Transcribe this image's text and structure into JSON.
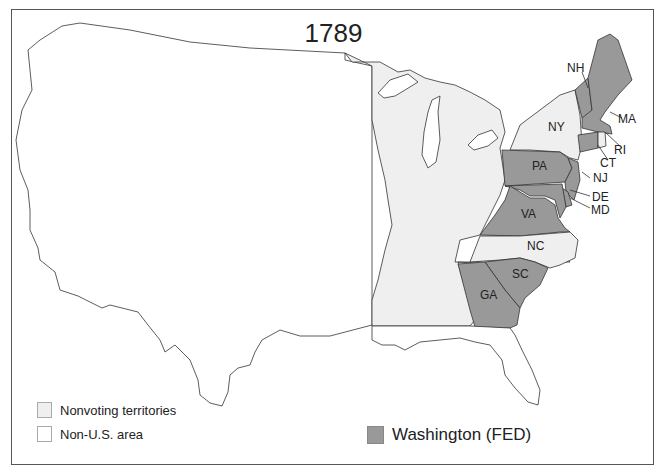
{
  "map": {
    "title": "1789",
    "colors": {
      "fed": "#999999",
      "nonvoting": "#efefef",
      "non_us": "#ffffff",
      "border": "#333333"
    },
    "states": [
      {
        "abbr": "NH",
        "party": "FED"
      },
      {
        "abbr": "MA",
        "party": "FED"
      },
      {
        "abbr": "RI",
        "party": "nonvoting"
      },
      {
        "abbr": "CT",
        "party": "FED"
      },
      {
        "abbr": "NY",
        "party": "nonvoting"
      },
      {
        "abbr": "NJ",
        "party": "FED"
      },
      {
        "abbr": "PA",
        "party": "FED"
      },
      {
        "abbr": "DE",
        "party": "FED"
      },
      {
        "abbr": "MD",
        "party": "FED"
      },
      {
        "abbr": "VA",
        "party": "FED"
      },
      {
        "abbr": "NC",
        "party": "nonvoting"
      },
      {
        "abbr": "SC",
        "party": "FED"
      },
      {
        "abbr": "GA",
        "party": "FED"
      }
    ]
  },
  "legend": {
    "nonvoting": "Nonvoting territories",
    "non_us": "Non-U.S. area",
    "fed": "Washington (FED)"
  }
}
